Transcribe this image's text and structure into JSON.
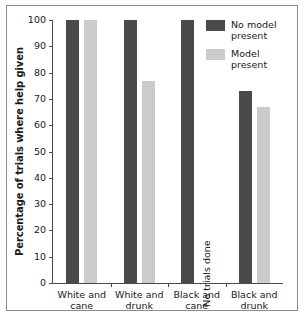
{
  "chart_data": {
    "type": "bar",
    "title": "",
    "xlabel": "",
    "ylabel": "Percentage of trials where help given",
    "ylim": [
      0,
      100
    ],
    "yticks": [
      0,
      10,
      20,
      30,
      40,
      50,
      60,
      70,
      80,
      90,
      100
    ],
    "grid": false,
    "legend_position": "top-right",
    "categories": [
      "White and cane",
      "White and drunk",
      "Black and cane",
      "Black and drunk"
    ],
    "series": [
      {
        "name": "No model present",
        "color": "#4a4a4a",
        "values": [
          100,
          100,
          100,
          73
        ]
      },
      {
        "name": "Model present",
        "color": "#cbcbcb",
        "values": [
          100,
          77,
          null,
          67
        ]
      }
    ],
    "annotations": [
      {
        "text": "No trials done",
        "category": "Black and cane",
        "series": "Model present",
        "orientation": "vertical"
      }
    ]
  },
  "legend": {
    "items": [
      {
        "label": "No model\npresent",
        "color": "#4a4a4a"
      },
      {
        "label": "Model\npresent",
        "color": "#cbcbcb"
      }
    ]
  },
  "axis": {
    "y_title": "Percentage of trials where help given",
    "tick_labels": [
      "100",
      "90",
      "80",
      "70",
      "60",
      "50",
      "40",
      "30",
      "20",
      "10",
      "0"
    ]
  },
  "x_labels": [
    "White and\ncane",
    "White and\ndrunk",
    "Black and\ncane",
    "Black and\ndrunk"
  ],
  "notes": {
    "no_trials": "No trials done"
  },
  "colors": {
    "dark_bar": "#4a4a4a",
    "light_bar": "#cbcbcb",
    "axis": "#4a4a4a",
    "frame": "#8d8d8d",
    "text": "#1a1a1a",
    "background": "#ffffff"
  }
}
